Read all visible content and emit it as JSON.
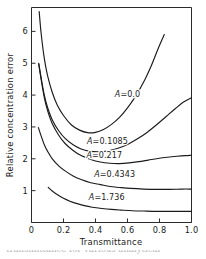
{
  "figure": {
    "background_color": "#ffffff",
    "line_color": "#1b1b1b",
    "axis_color": "#2b2b2b",
    "caption_partial": "transmittance for various analytical"
  },
  "chart_data": {
    "type": "line",
    "title": "",
    "xlabel": "Transmittance",
    "ylabel": "Relative concentration error",
    "xlim": [
      0.0,
      1.0
    ],
    "ylim": [
      0.0,
      6.75
    ],
    "xticks": [
      0,
      0.2,
      0.4,
      0.6,
      0.8,
      1.0
    ],
    "xtick_labels": [
      "0",
      "0.2",
      "0.4",
      "0.6",
      "0.8",
      "1.0"
    ],
    "yticks": [
      1,
      2,
      3,
      4,
      5,
      6
    ],
    "ytick_labels": [
      "1",
      "2",
      "3",
      "4",
      "5",
      "6"
    ],
    "grid": false,
    "legend_position": "inline-annotations",
    "series": [
      {
        "name": "A=0.0",
        "label": "A=0.0",
        "label_x": 0.6,
        "label_y": 3.95,
        "x": [
          0.048,
          0.06,
          0.08,
          0.1,
          0.13,
          0.16,
          0.2,
          0.25,
          0.3,
          0.35,
          0.4,
          0.45,
          0.5,
          0.55,
          0.6,
          0.65,
          0.7,
          0.75,
          0.79,
          0.83
        ],
        "y": [
          6.62,
          5.95,
          5.15,
          4.62,
          4.08,
          3.7,
          3.36,
          3.06,
          2.9,
          2.82,
          2.83,
          2.92,
          3.08,
          3.3,
          3.6,
          3.96,
          4.4,
          4.94,
          5.44,
          5.9
        ]
      },
      {
        "name": "A=0.1085",
        "label": "A=0.1085",
        "label_x": 0.475,
        "label_y": 2.45,
        "x": [
          0.045,
          0.06,
          0.08,
          0.1,
          0.13,
          0.17,
          0.21,
          0.26,
          0.31,
          0.36,
          0.42,
          0.48,
          0.54,
          0.6,
          0.66,
          0.72,
          0.78,
          0.84,
          0.9,
          0.95,
          1.0
        ],
        "y": [
          5.0,
          4.55,
          4.0,
          3.62,
          3.22,
          2.88,
          2.64,
          2.44,
          2.31,
          2.24,
          2.22,
          2.25,
          2.33,
          2.45,
          2.62,
          2.82,
          3.06,
          3.32,
          3.58,
          3.78,
          3.92
        ]
      },
      {
        "name": "A=0.217",
        "label": "A=0.217",
        "label_x": 0.455,
        "label_y": 2.02,
        "x": [
          0.045,
          0.06,
          0.08,
          0.1,
          0.13,
          0.17,
          0.21,
          0.26,
          0.31,
          0.37,
          0.43,
          0.49,
          0.55,
          0.61,
          0.67,
          0.73,
          0.79,
          0.85,
          0.91,
          0.96,
          1.0
        ],
        "y": [
          4.98,
          4.5,
          3.92,
          3.52,
          3.1,
          2.74,
          2.48,
          2.26,
          2.1,
          1.98,
          1.9,
          1.86,
          1.85,
          1.87,
          1.91,
          1.96,
          2.01,
          2.05,
          2.08,
          2.1,
          2.11
        ]
      },
      {
        "name": "A=0.4343",
        "label": "A=0.4343",
        "label_x": 0.52,
        "label_y": 1.42,
        "x": [
          0.043,
          0.06,
          0.08,
          0.1,
          0.13,
          0.17,
          0.21,
          0.26,
          0.31,
          0.37,
          0.43,
          0.49,
          0.55,
          0.62,
          0.7,
          0.78,
          0.86,
          0.94,
          1.0
        ],
        "y": [
          2.98,
          2.72,
          2.44,
          2.24,
          2.0,
          1.78,
          1.62,
          1.46,
          1.35,
          1.25,
          1.19,
          1.13,
          1.1,
          1.07,
          1.05,
          1.04,
          1.04,
          1.05,
          1.05
        ]
      },
      {
        "name": "A=1.736",
        "label": "A=1.736",
        "label_x": 0.47,
        "label_y": 0.72,
        "x": [
          0.105,
          0.13,
          0.16,
          0.2,
          0.24,
          0.28,
          0.33,
          0.38,
          0.44,
          0.5,
          0.56,
          0.63,
          0.7,
          0.78,
          0.86,
          0.94,
          1.0
        ],
        "y": [
          1.1,
          0.99,
          0.88,
          0.76,
          0.67,
          0.6,
          0.53,
          0.48,
          0.44,
          0.41,
          0.39,
          0.37,
          0.36,
          0.35,
          0.35,
          0.35,
          0.35
        ]
      }
    ]
  }
}
